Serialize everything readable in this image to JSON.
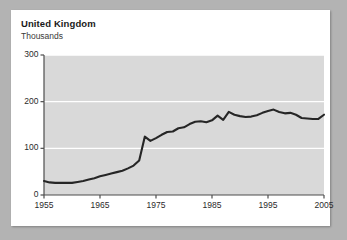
{
  "figure": {
    "title": "United Kingdom",
    "subtitle": "Thousands",
    "background_color": "#b3b3b3",
    "card_color": "#ffffff",
    "plot_background_color": "#d9d9d9",
    "gridline_color": "#ffffff",
    "line_color": "#262626",
    "axis_color": "#4d4d4d",
    "text_color": "#1a1a1a"
  },
  "chart_data": {
    "type": "line",
    "title": "United Kingdom",
    "subtitle": "Thousands",
    "xlabel": "",
    "ylabel": "Thousands",
    "xlim": [
      1955,
      2005
    ],
    "ylim": [
      0,
      300
    ],
    "grid": true,
    "legend": "none",
    "ytick_labels": [
      "0",
      "100",
      "200",
      "300"
    ],
    "ytick_values": [
      0,
      100,
      200,
      300
    ],
    "xtick_labels": [
      "1955",
      "1965",
      "1975",
      "1985",
      "1995",
      "2005"
    ],
    "xtick_values": [
      1955,
      1965,
      1975,
      1985,
      1995,
      2005
    ],
    "series": [
      {
        "name": "United Kingdom",
        "x": [
          1955,
          1956,
          1957,
          1958,
          1959,
          1960,
          1961,
          1962,
          1963,
          1964,
          1965,
          1966,
          1967,
          1968,
          1969,
          1970,
          1971,
          1972,
          1973,
          1974,
          1975,
          1976,
          1977,
          1978,
          1979,
          1980,
          1981,
          1982,
          1983,
          1984,
          1985,
          1986,
          1987,
          1988,
          1989,
          1990,
          1991,
          1992,
          1993,
          1994,
          1995,
          1996,
          1997,
          1998,
          1999,
          2000,
          2001,
          2002,
          2003,
          2004,
          2005
        ],
        "values": [
          30,
          27,
          26,
          26,
          26,
          26,
          28,
          30,
          33,
          36,
          40,
          43,
          46,
          49,
          52,
          57,
          63,
          74,
          125,
          116,
          122,
          129,
          135,
          136,
          143,
          145,
          152,
          157,
          158,
          156,
          160,
          170,
          161,
          178,
          172,
          169,
          167,
          168,
          171,
          176,
          180,
          183,
          178,
          175,
          176,
          172,
          165,
          164,
          163,
          163,
          172
        ]
      }
    ]
  },
  "axes": {
    "y_ticks": [
      {
        "label": "300",
        "value": 300
      },
      {
        "label": "200",
        "value": 200
      },
      {
        "label": "100",
        "value": 100
      },
      {
        "label": "0",
        "value": 0
      }
    ],
    "x_ticks": [
      {
        "label": "1955",
        "value": 1955
      },
      {
        "label": "1965",
        "value": 1965
      },
      {
        "label": "1975",
        "value": 1975
      },
      {
        "label": "1985",
        "value": 1985
      },
      {
        "label": "1995",
        "value": 1995
      },
      {
        "label": "2005",
        "value": 2005
      }
    ]
  }
}
